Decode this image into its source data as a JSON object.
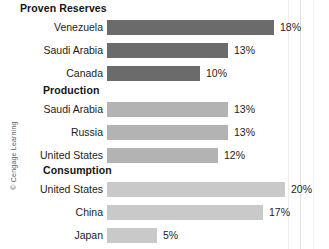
{
  "credit": "© Cengage Learning",
  "chart_data": {
    "type": "bar",
    "orientation": "horizontal",
    "title": "",
    "xlabel": "",
    "ylabel": "",
    "xlim": [
      0,
      22
    ],
    "grid": false,
    "legend": "none",
    "value_suffix": "%",
    "groups": [
      {
        "name": "Proven Reserves",
        "color": "#6b6b6b",
        "categories": [
          "Venezuela",
          "Saudi Arabia",
          "Canada"
        ],
        "values": [
          18,
          13,
          10
        ],
        "value_labels": [
          "18%",
          "13%",
          "10%"
        ]
      },
      {
        "name": "Production",
        "color": "#b3b3b3",
        "categories": [
          "Saudi Arabia",
          "Russia",
          "United States"
        ],
        "values": [
          13,
          13,
          12
        ],
        "value_labels": [
          "13%",
          "13%",
          "12%"
        ]
      },
      {
        "name": "Consumption",
        "color": "#c9c9c9",
        "categories": [
          "United States",
          "China",
          "Japan"
        ],
        "values": [
          20,
          17,
          5
        ],
        "value_labels": [
          "20%",
          "17%",
          "5%"
        ]
      }
    ]
  },
  "groups": [
    {
      "title": "Proven Reserves",
      "title_left": 20,
      "title_top": 2,
      "color": "#6b6b6b",
      "rows": [
        {
          "label": "Venezuela",
          "value_label": "18%",
          "bar_width": 167,
          "row_top": 17
        },
        {
          "label": "Saudi Arabia",
          "value_label": "13%",
          "bar_width": 121,
          "row_top": 40
        },
        {
          "label": "Canada",
          "value_label": "10%",
          "bar_width": 93,
          "row_top": 63
        }
      ]
    },
    {
      "title": "Production",
      "title_left": 43,
      "title_top": 84,
      "color": "#b3b3b3",
      "rows": [
        {
          "label": "Saudi Arabia",
          "value_label": "13%",
          "bar_width": 121,
          "row_top": 99
        },
        {
          "label": "Russia",
          "value_label": "13%",
          "bar_width": 121,
          "row_top": 122
        },
        {
          "label": "United States",
          "value_label": "12%",
          "bar_width": 111,
          "row_top": 145
        }
      ]
    },
    {
      "title": "Consumption",
      "title_left": 43,
      "title_top": 164,
      "color": "#c9c9c9",
      "rows": [
        {
          "label": "United States",
          "value_label": "20%",
          "bar_width": 178,
          "row_top": 179
        },
        {
          "label": "China",
          "value_label": "17%",
          "bar_width": 156,
          "row_top": 202
        },
        {
          "label": "Japan",
          "value_label": "5%",
          "bar_width": 50,
          "row_top": 225
        }
      ]
    }
  ]
}
